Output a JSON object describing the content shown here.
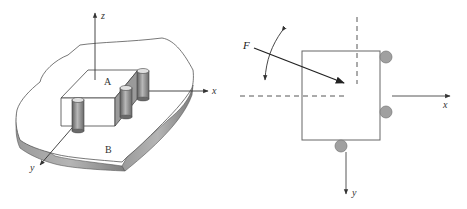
{
  "left_figure": {
    "axis_labels": {
      "z": "z",
      "x": "x",
      "y": "y"
    },
    "region_labels": {
      "top_block": "A",
      "base_plate": "B"
    },
    "colors": {
      "line": "#333333",
      "plate_edge": "#8c8c8c",
      "pin_dark": "#6a6a6a",
      "pin_light": "#c8c8c8",
      "block_side": "#9a9a9a"
    },
    "pins": [
      "front-left pin",
      "center pin",
      "back-right pin"
    ]
  },
  "right_figure": {
    "force_label": "F",
    "axis_labels": {
      "x": "x",
      "y": "y"
    },
    "colors": {
      "line": "#555555",
      "force_arrow": "#222222",
      "roller": "#a0a0a0",
      "dashed": "#444444"
    },
    "rollers": [
      "right-top roller",
      "right-bottom roller",
      "bottom roller"
    ]
  }
}
